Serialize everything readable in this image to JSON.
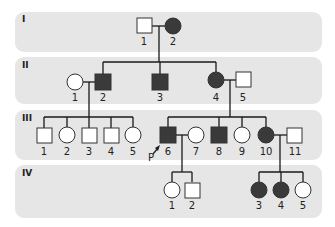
{
  "colors": {
    "affected": "#3a3a3a",
    "unaffected": "#ffffff",
    "band": "#e6e6e6",
    "line": "#1a1a1a"
  },
  "generations": [
    {
      "label": "I",
      "members": [
        {
          "id": "1",
          "sex": "male",
          "affected": false
        },
        {
          "id": "2",
          "sex": "female",
          "affected": true
        }
      ]
    },
    {
      "label": "II",
      "members": [
        {
          "id": "1",
          "sex": "female",
          "affected": false
        },
        {
          "id": "2",
          "sex": "male",
          "affected": true
        },
        {
          "id": "3",
          "sex": "male",
          "affected": true
        },
        {
          "id": "4",
          "sex": "female",
          "affected": true
        },
        {
          "id": "5",
          "sex": "male",
          "affected": false
        }
      ]
    },
    {
      "label": "III",
      "members": [
        {
          "id": "1",
          "sex": "male",
          "affected": false
        },
        {
          "id": "2",
          "sex": "female",
          "affected": false
        },
        {
          "id": "3",
          "sex": "male",
          "affected": false
        },
        {
          "id": "4",
          "sex": "male",
          "affected": false
        },
        {
          "id": "5",
          "sex": "female",
          "affected": false
        },
        {
          "id": "6",
          "sex": "male",
          "affected": true,
          "proband": true
        },
        {
          "id": "7",
          "sex": "female",
          "affected": false
        },
        {
          "id": "8",
          "sex": "male",
          "affected": true
        },
        {
          "id": "9",
          "sex": "female",
          "affected": false
        },
        {
          "id": "10",
          "sex": "female",
          "affected": true
        },
        {
          "id": "11",
          "sex": "male",
          "affected": false
        }
      ]
    },
    {
      "label": "IV",
      "members": [
        {
          "id": "1",
          "sex": "female",
          "affected": false
        },
        {
          "id": "2",
          "sex": "male",
          "affected": false
        },
        {
          "id": "3",
          "sex": "female",
          "affected": true
        },
        {
          "id": "4",
          "sex": "female",
          "affected": true
        },
        {
          "id": "5",
          "sex": "female",
          "affected": false
        }
      ]
    }
  ],
  "proband_label": "P"
}
